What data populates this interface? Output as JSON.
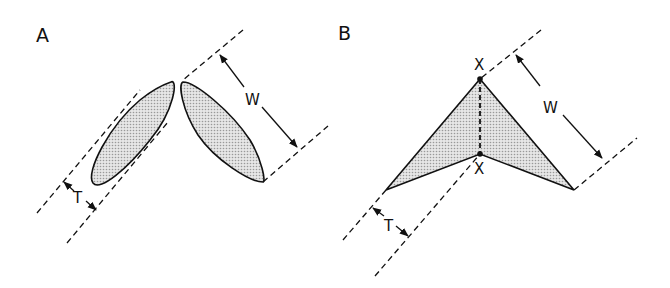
{
  "panels": [
    {
      "id": "A",
      "label": "A",
      "description": "Two separated elliptical lobes tilted in V shape",
      "dimensions": {
        "width_label": "W",
        "thickness_label": "T"
      }
    },
    {
      "id": "B",
      "label": "B",
      "description": "Chevron / arrowhead shaped shaded polygon with fold line between points X",
      "dimensions": {
        "width_label": "W",
        "thickness_label": "T"
      },
      "points": {
        "top": "X",
        "bottom": "X"
      }
    }
  ],
  "colors": {
    "stroke": "#111111",
    "fill": "#d4d4d4",
    "background": "#ffffff"
  }
}
